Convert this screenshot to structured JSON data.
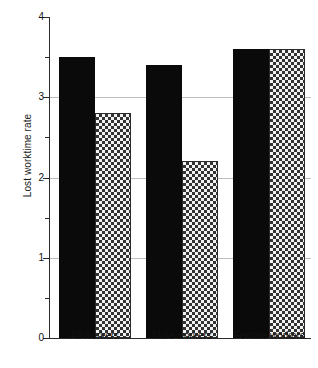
{
  "chart_data": {
    "type": "bar",
    "title": "",
    "xlabel": "",
    "ylabel": "Lost worktime rate",
    "ylim": [
      0,
      4
    ],
    "yticks": [
      0,
      1,
      2,
      3,
      4
    ],
    "ytick_labels": [
      "0",
      "1",
      "2",
      "3",
      "4"
    ],
    "yminor_ticks": [
      0.5,
      1.5,
      2.5,
      3.5
    ],
    "grid": true,
    "grid_axis": "y",
    "legend": null,
    "categories": [
      "All workers",
      "Male workers",
      "Female workers"
    ],
    "series": [
      {
        "name": "series-1",
        "style": "solid-black",
        "color": "#0a0a0a",
        "values": [
          3.5,
          3.4,
          3.6
        ]
      },
      {
        "name": "series-2",
        "style": "checkered-hatch",
        "color": "#f2f2f2",
        "values": [
          2.8,
          2.2,
          3.6
        ]
      }
    ]
  },
  "axis": {
    "y_title": "Lost worktime rate"
  }
}
